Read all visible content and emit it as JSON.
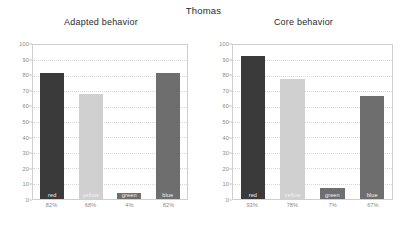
{
  "figure": {
    "suptitle": "Thomas"
  },
  "chart_data": [
    {
      "type": "bar",
      "title": "Adapted behavior",
      "categories": [
        "red",
        "yellow",
        "green",
        "blue"
      ],
      "values": [
        82,
        68,
        4,
        82
      ],
      "value_labels": [
        "82%",
        "68%",
        "4%",
        "82%"
      ],
      "bar_colors": [
        "#3a3a3a",
        "#d0d0d0",
        "#6e6e6e",
        "#6e6e6e"
      ],
      "xlabel": "",
      "ylabel": "",
      "ylim": [
        0,
        100
      ],
      "yticks": [
        0,
        10,
        20,
        30,
        40,
        50,
        60,
        70,
        80,
        90,
        100
      ],
      "ytick_labels": [
        "0",
        "10",
        "20",
        "30",
        "40",
        "50",
        "60",
        "70",
        "80",
        "90",
        "100"
      ],
      "grid": true,
      "legend": false
    },
    {
      "type": "bar",
      "title": "Core behavior",
      "categories": [
        "red",
        "yellow",
        "green",
        "blue"
      ],
      "values": [
        93,
        78,
        7,
        67
      ],
      "value_labels": [
        "93%",
        "78%",
        "7%",
        "67%"
      ],
      "bar_colors": [
        "#3a3a3a",
        "#d0d0d0",
        "#6e6e6e",
        "#6e6e6e"
      ],
      "xlabel": "",
      "ylabel": "",
      "ylim": [
        0,
        100
      ],
      "yticks": [
        0,
        10,
        20,
        30,
        40,
        50,
        60,
        70,
        80,
        90,
        100
      ],
      "ytick_labels": [
        "0",
        "10",
        "20",
        "30",
        "40",
        "50",
        "60",
        "70",
        "80",
        "90",
        "100"
      ],
      "grid": true,
      "legend": false
    }
  ]
}
